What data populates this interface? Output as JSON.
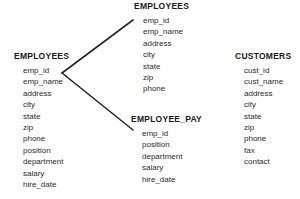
{
  "diagram": {
    "background_color": "#ffffff",
    "line_color": "#262626",
    "text_color": "#2b2b2b",
    "title_color": "#1a1a1a",
    "entities": [
      {
        "id": "employees-left",
        "name": "EMPLOYEES",
        "fields": [
          "emp_id",
          "emp_name",
          "address",
          "city",
          "state",
          "zip",
          "phone",
          "position",
          "department",
          "salary",
          "hire_date"
        ]
      },
      {
        "id": "employees-top",
        "name": "EMPLOYEES",
        "fields": [
          "emp_id",
          "emp_name",
          "address",
          "city",
          "state",
          "zip",
          "phone"
        ]
      },
      {
        "id": "employee-pay",
        "name": "EMPLOYEE_PAY",
        "fields": [
          "emp_id",
          "position",
          "department",
          "salary",
          "hire_date"
        ]
      },
      {
        "id": "customers",
        "name": "CUSTOMERS",
        "fields": [
          "cust_id",
          "cust_name",
          "address",
          "city",
          "state",
          "zip",
          "phone",
          "fax",
          "contact"
        ]
      }
    ],
    "relationships": [
      {
        "id": "employees-to-employees",
        "from": "employees-left",
        "to": "employees-top",
        "x1": 62,
        "y1": 73,
        "x2": 133,
        "y2": 20
      },
      {
        "id": "employees-to-employee-pay",
        "from": "employees-left",
        "to": "employee-pay",
        "x1": 62,
        "y1": 73,
        "x2": 133,
        "y2": 130
      }
    ]
  }
}
